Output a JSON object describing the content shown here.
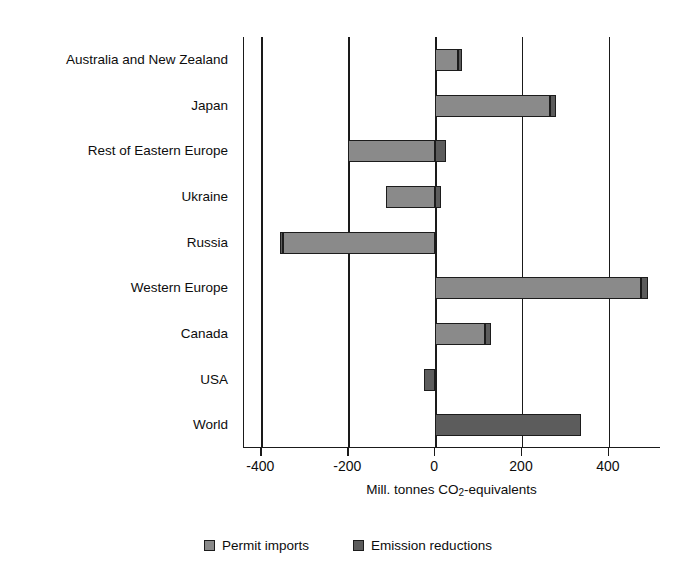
{
  "chart_data": {
    "type": "bar",
    "orientation": "horizontal",
    "stacked": true,
    "title": "",
    "xlabel": "Mill. tonnes CO2-equivalents",
    "xlabel_parts": {
      "pre": "Mill. tonnes CO",
      "sub": "2",
      "post": "-equivalents"
    },
    "ylabel": "",
    "xlim": [
      -440,
      520
    ],
    "xticks": [
      -400,
      -200,
      0,
      200,
      400
    ],
    "xticklabels": [
      "-400",
      "-200",
      "0",
      "200",
      "400"
    ],
    "grid": "vertical",
    "legend_position": "bottom",
    "categories": [
      "Australia and New Zealand",
      "Japan",
      "Rest of Eastern Europe",
      "Ukraine",
      "Russia",
      "Western Europe",
      "Canada",
      "USA",
      "World"
    ],
    "series": [
      {
        "name": "Permit imports",
        "color": "#8a8a8a",
        "values": [
          52,
          265,
          -200,
          -112,
          -350,
          475,
          115,
          0,
          0
        ]
      },
      {
        "name": "Emission reductions",
        "color": "#5c5c5c",
        "values": [
          11,
          14,
          25,
          14,
          -8,
          15,
          13,
          -25,
          335
        ]
      }
    ],
    "bar_totals": [
      63,
      279,
      -175,
      -98,
      -358,
      490,
      128,
      -25,
      335
    ],
    "notes": [
      "Bars are stacked from zero: the Permit imports segment starts at 0 and the Emission reductions segment is appended at the far end.",
      "Rest of Eastern Europe and Ukraine have a negative Permit imports segment plus a small positive Emission reductions segment.",
      "USA shows only a small negative Emission reductions bar.",
      "World shows only an Emission reductions bar."
    ]
  },
  "legend": {
    "items": [
      {
        "label": "Permit imports",
        "color": "#8a8a8a"
      },
      {
        "label": "Emission reductions",
        "color": "#5c5c5c"
      }
    ]
  }
}
